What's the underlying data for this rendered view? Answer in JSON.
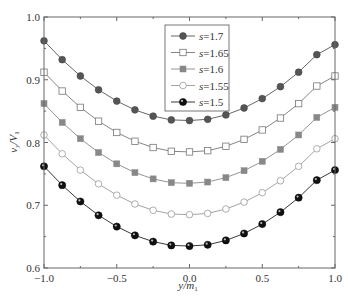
{
  "chart_data": {
    "type": "line",
    "title": "",
    "xlabel": "y/m1",
    "xlabel_main": "y/m",
    "xlabel_sub": "1",
    "ylabel": "vy/V1",
    "ylabel_main": "v",
    "ylabel_sub1": "y",
    "ylabel_mid": "/V",
    "ylabel_sub2": "1",
    "xlim": [
      -1.0,
      1.0
    ],
    "ylim": [
      0.6,
      1.0
    ],
    "xticks": [
      -1.0,
      -0.5,
      0.0,
      0.5,
      1.0
    ],
    "xtick_labels": [
      "−1.0",
      "−0.5",
      "0.0",
      "0.5",
      "1.0"
    ],
    "yticks": [
      0.6,
      0.7,
      0.8,
      0.9,
      1.0
    ],
    "ytick_labels": [
      "0.6",
      "0.7",
      "0.8",
      "0.9",
      "1.0"
    ],
    "grid": false,
    "legend_position": "upper center",
    "x": [
      -1.0,
      -0.875,
      -0.75,
      -0.625,
      -0.5,
      -0.375,
      -0.25,
      -0.125,
      0.0,
      0.125,
      0.25,
      0.375,
      0.5,
      0.625,
      0.75,
      0.875,
      1.0
    ],
    "series": [
      {
        "name": "s=1.7",
        "s_value": "1.7",
        "marker": "filled-circle-gray",
        "color": "#555555",
        "values": [
          0.962,
          0.932,
          0.906,
          0.884,
          0.866,
          0.852,
          0.842,
          0.836,
          0.835,
          0.837,
          0.844,
          0.855,
          0.87,
          0.889,
          0.912,
          0.94,
          0.956
        ]
      },
      {
        "name": "s=1.65",
        "s_value": "1.65",
        "marker": "open-square",
        "color": "#777777",
        "values": [
          0.912,
          0.882,
          0.856,
          0.834,
          0.816,
          0.802,
          0.792,
          0.786,
          0.785,
          0.787,
          0.794,
          0.805,
          0.82,
          0.839,
          0.862,
          0.89,
          0.906
        ]
      },
      {
        "name": "s=1.6",
        "s_value": "1.6",
        "marker": "filled-square-gray",
        "color": "#888888",
        "values": [
          0.862,
          0.832,
          0.806,
          0.784,
          0.766,
          0.752,
          0.742,
          0.736,
          0.735,
          0.737,
          0.744,
          0.755,
          0.77,
          0.789,
          0.812,
          0.84,
          0.856
        ]
      },
      {
        "name": "s=1.55",
        "s_value": "1.55",
        "marker": "open-circle",
        "color": "#999999",
        "values": [
          0.812,
          0.782,
          0.756,
          0.734,
          0.716,
          0.702,
          0.692,
          0.686,
          0.685,
          0.687,
          0.694,
          0.705,
          0.72,
          0.739,
          0.762,
          0.79,
          0.806
        ]
      },
      {
        "name": "s=1.5",
        "s_value": "1.5",
        "marker": "filled-circle-black",
        "color": "#222222",
        "values": [
          0.762,
          0.732,
          0.706,
          0.684,
          0.666,
          0.652,
          0.642,
          0.636,
          0.635,
          0.637,
          0.644,
          0.655,
          0.67,
          0.689,
          0.712,
          0.74,
          0.756
        ]
      }
    ]
  },
  "legend": {
    "items": [
      {
        "prefix": "s",
        "eq": "=1.7"
      },
      {
        "prefix": "s",
        "eq": "=1.65"
      },
      {
        "prefix": "s",
        "eq": "=1.6"
      },
      {
        "prefix": "s",
        "eq": "=1.55"
      },
      {
        "prefix": "s",
        "eq": "=1.5"
      }
    ]
  }
}
